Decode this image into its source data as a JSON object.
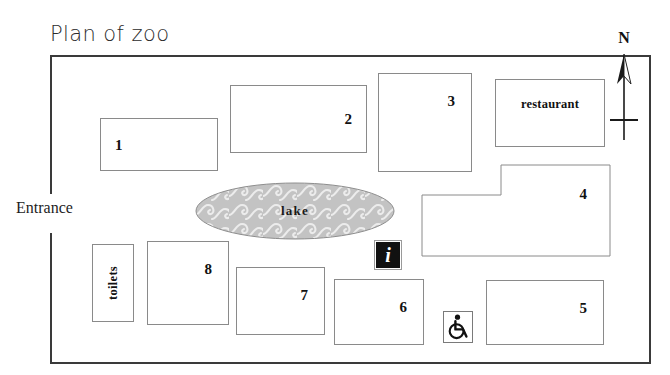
{
  "map": {
    "title": "Plan of zoo",
    "entrance_label": "Entrance",
    "compass_label": "N",
    "border_color": "#3a3a3a",
    "enclosure_border_color": "#8a8a8a"
  },
  "enclosures": [
    {
      "label": "1",
      "name": "enclosure-1"
    },
    {
      "label": "2",
      "name": "enclosure-2"
    },
    {
      "label": "3",
      "name": "enclosure-3"
    },
    {
      "label": "4",
      "name": "enclosure-4"
    },
    {
      "label": "5",
      "name": "enclosure-5"
    },
    {
      "label": "6",
      "name": "enclosure-6"
    },
    {
      "label": "7",
      "name": "enclosure-7"
    },
    {
      "label": "8",
      "name": "enclosure-8"
    }
  ],
  "facilities": {
    "restaurant_label": "restaurant",
    "toilets_label": "toilets",
    "information_glyph": "i",
    "information_name": "information-icon",
    "accessibility_name": "wheelchair-accessible-icon"
  },
  "water": {
    "lake_label": "lake",
    "fill_color": "#c3c3c3",
    "wave_color": "#ececec",
    "outline_color": "#8e8e8e"
  }
}
